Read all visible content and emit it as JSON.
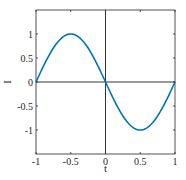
{
  "chart_data": {
    "type": "line",
    "title": "",
    "xlabel": "t",
    "ylabel": "I",
    "xlim": [
      -1,
      1
    ],
    "ylim": [
      -1.5,
      1.5
    ],
    "xticks": [
      -1,
      -0.5,
      0,
      0.5,
      1
    ],
    "xtick_labels": [
      "-1",
      "-0.5",
      "0",
      "0.5",
      "1"
    ],
    "yticks": [
      -1,
      -0.5,
      0,
      0.5,
      1
    ],
    "ytick_labels": [
      "-1",
      "-0.5",
      "0",
      "0.5",
      "1"
    ],
    "grid": false,
    "box": true,
    "reference_lines": {
      "x": 0,
      "y": 0
    },
    "legend": null,
    "series": [
      {
        "name": "I(t) = -sin(pi t)",
        "color": "#0072BD",
        "x": [
          -1,
          -0.9,
          -0.8,
          -0.7,
          -0.6,
          -0.5,
          -0.4,
          -0.3,
          -0.2,
          -0.1,
          0,
          0.1,
          0.2,
          0.3,
          0.4,
          0.5,
          0.6,
          0.7,
          0.8,
          0.9,
          1
        ],
        "y": [
          0,
          0.309,
          0.588,
          0.809,
          0.951,
          1,
          0.951,
          0.809,
          0.588,
          0.309,
          0,
          -0.309,
          -0.588,
          -0.809,
          -0.951,
          -1,
          -0.951,
          -0.809,
          -0.588,
          -0.309,
          0
        ]
      }
    ]
  },
  "colors": {
    "axis": "#262626",
    "line": "#0072BD",
    "background": "#ffffff"
  }
}
